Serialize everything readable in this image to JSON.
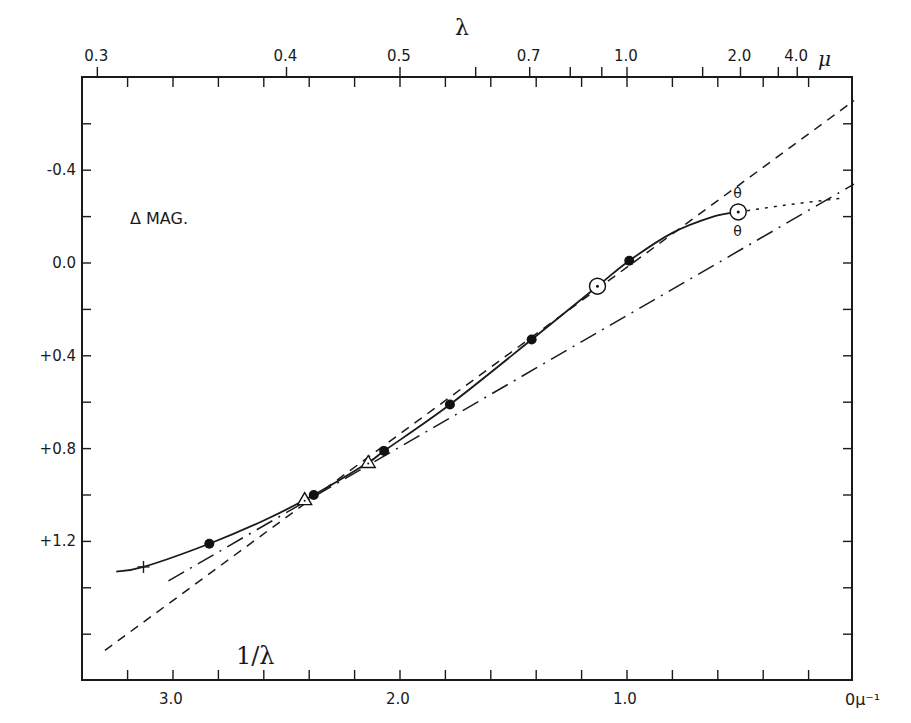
{
  "chart_data": {
    "type": "line",
    "title": "",
    "annotation": "Δ MAG.",
    "xlabel": "1/λ",
    "xlabel_unit": "0μ⁻¹",
    "x2label": "λ",
    "x2label_unit": "μ",
    "ylabel": "Δ MAG.",
    "xlim": [
      3.37,
      0.0
    ],
    "ylim": [
      -0.8,
      1.8
    ],
    "y_inverted": true,
    "grid": false,
    "x_ticks": [
      {
        "value": 3.0,
        "label": "3.0"
      },
      {
        "value": 2.0,
        "label": "2.0"
      },
      {
        "value": 1.0,
        "label": "1.0"
      },
      {
        "value": 0.0,
        "label": "0"
      }
    ],
    "x_minor_step": 0.2,
    "x2_ticks": [
      {
        "value": 0.3,
        "label": "0.3"
      },
      {
        "value": 0.4,
        "label": "0.4"
      },
      {
        "value": 0.5,
        "label": "0.5"
      },
      {
        "value": 0.6,
        "label": ""
      },
      {
        "value": 0.7,
        "label": "0.7"
      },
      {
        "value": 0.8,
        "label": ""
      },
      {
        "value": 0.9,
        "label": ""
      },
      {
        "value": 1.0,
        "label": "1.0"
      },
      {
        "value": 1.5,
        "label": ""
      },
      {
        "value": 2.0,
        "label": "2.0"
      },
      {
        "value": 3.0,
        "label": ""
      },
      {
        "value": 4.0,
        "label": "4.0"
      }
    ],
    "y_ticks": [
      {
        "value": -0.4,
        "label": "-0.4"
      },
      {
        "value": 0.0,
        "label": "0.0"
      },
      {
        "value": 0.4,
        "label": "+0.4"
      },
      {
        "value": 0.8,
        "label": "+0.8"
      },
      {
        "value": 1.2,
        "label": "+1.2"
      }
    ],
    "y_minor_step": 0.2,
    "series": [
      {
        "name": "observed points (filled circles)",
        "marker": "filled-circle",
        "points": [
          {
            "x": 2.84,
            "y": 1.21
          },
          {
            "x": 2.38,
            "y": 1.0
          },
          {
            "x": 2.07,
            "y": 0.81
          },
          {
            "x": 1.78,
            "y": 0.61
          },
          {
            "x": 1.42,
            "y": 0.33
          },
          {
            "x": 0.99,
            "y": -0.01
          }
        ]
      },
      {
        "name": "open triangles",
        "marker": "open-triangle",
        "points": [
          {
            "x": 2.42,
            "y": 1.02
          },
          {
            "x": 2.14,
            "y": 0.86
          }
        ]
      },
      {
        "name": "circled dot",
        "marker": "circle-dot",
        "points": [
          {
            "x": 1.13,
            "y": 0.1
          },
          {
            "x": 0.51,
            "y": -0.22
          }
        ]
      },
      {
        "name": "cross",
        "marker": "plus",
        "points": [
          {
            "x": 3.13,
            "y": 1.31
          }
        ]
      },
      {
        "name": "fitted curve (solid)",
        "style": "solid",
        "points": [
          {
            "x": 3.25,
            "y": 1.33
          },
          {
            "x": 3.13,
            "y": 1.31
          },
          {
            "x": 2.84,
            "y": 1.21
          },
          {
            "x": 2.6,
            "y": 1.11
          },
          {
            "x": 2.38,
            "y": 1.0
          },
          {
            "x": 2.14,
            "y": 0.86
          },
          {
            "x": 2.07,
            "y": 0.81
          },
          {
            "x": 1.78,
            "y": 0.61
          },
          {
            "x": 1.42,
            "y": 0.33
          },
          {
            "x": 1.13,
            "y": 0.1
          },
          {
            "x": 0.99,
            "y": -0.01
          },
          {
            "x": 0.8,
            "y": -0.13
          },
          {
            "x": 0.62,
            "y": -0.2
          },
          {
            "x": 0.51,
            "y": -0.22
          }
        ]
      },
      {
        "name": "extrapolation (dotted)",
        "style": "dotted",
        "points": [
          {
            "x": 0.51,
            "y": -0.22
          },
          {
            "x": 0.3,
            "y": -0.25
          },
          {
            "x": 0.05,
            "y": -0.28
          }
        ]
      },
      {
        "name": "linear law (dashed)",
        "style": "dashed",
        "points": [
          {
            "x": 3.3,
            "y": 1.67
          },
          {
            "x": 0.0,
            "y": -0.7
          }
        ]
      },
      {
        "name": "linear law (dash-dot)",
        "style": "dash-dot",
        "points": [
          {
            "x": 3.02,
            "y": 1.37
          },
          {
            "x": 0.0,
            "y": -0.34
          }
        ]
      }
    ],
    "small_markers": [
      {
        "x": 0.51,
        "y": -0.3,
        "glyph": "θ"
      },
      {
        "x": 0.51,
        "y": -0.14,
        "glyph": "θ"
      }
    ]
  }
}
